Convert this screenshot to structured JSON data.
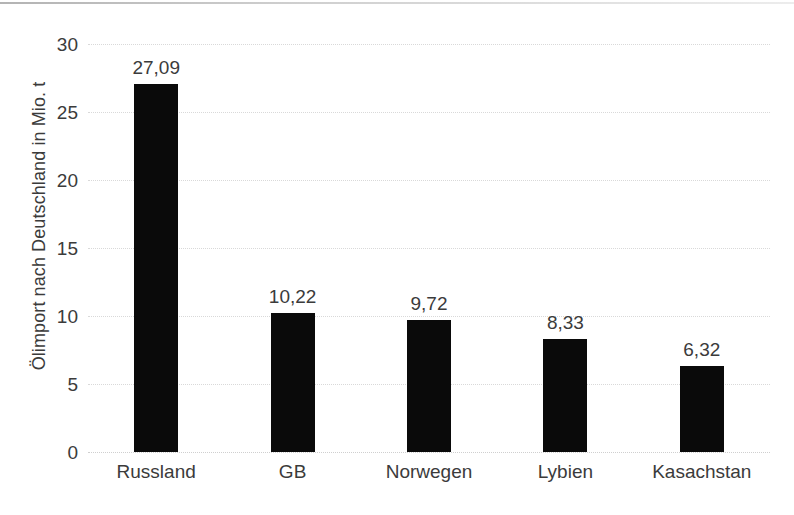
{
  "chart_data": {
    "type": "bar",
    "title": "",
    "subtitle": "",
    "xlabel": "",
    "ylabel": "Ölimport nach Deutschland in Mio. t",
    "categories": [
      "Russland",
      "GB",
      "Norwegen",
      "Lybien",
      "Kasachstan"
    ],
    "values": [
      27.09,
      10.22,
      9.72,
      8.33,
      6.32
    ],
    "value_labels": [
      "27,09",
      "10,22",
      "9,72",
      "8,33",
      "6,32"
    ],
    "ylim": [
      0,
      30
    ],
    "yticks": [
      0,
      5,
      10,
      15,
      20,
      25,
      30
    ],
    "ytick_labels": [
      "0",
      "5",
      "10",
      "15",
      "20",
      "25",
      "30"
    ],
    "grid": true,
    "grid_axis": "y",
    "legend": "none",
    "bar_color": "#0a0a0a",
    "grid_color": "#d9d9d9",
    "text_color": "#3b3b3b",
    "background_color": "#ffffff"
  }
}
